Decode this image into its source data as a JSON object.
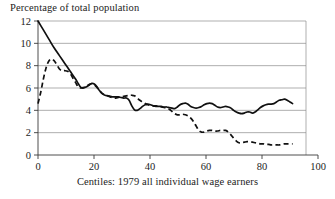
{
  "chart_data": {
    "type": "line",
    "title": "Percentage of total population",
    "xlabel": "Centiles: 1979 all individual wage earners",
    "ylabel": "",
    "xlim": [
      0,
      100
    ],
    "ylim": [
      0,
      12
    ],
    "grid": true,
    "legend": "none",
    "xticks": [
      "0",
      "20",
      "40",
      "60",
      "80",
      "100"
    ],
    "xtick_values": [
      0,
      20,
      40,
      60,
      80,
      100
    ],
    "yticks": [
      "0",
      "2",
      "4",
      "6",
      "8",
      "10",
      "12"
    ],
    "ytick_values": [
      0,
      2,
      4,
      6,
      8,
      10,
      12
    ],
    "series": [
      {
        "name": "solid-series",
        "style": "solid",
        "x": [
          0,
          2,
          4,
          6,
          8,
          10,
          12,
          14,
          15,
          16,
          17,
          18,
          19,
          20,
          21,
          22,
          23,
          24,
          25,
          26,
          27,
          28,
          29,
          30,
          31,
          32,
          33,
          34,
          35,
          36,
          37,
          38,
          39,
          40,
          41,
          42,
          43,
          44,
          45,
          46,
          47,
          48,
          49,
          50,
          51,
          52,
          53,
          54,
          55,
          56,
          57,
          58,
          59,
          60,
          61,
          62,
          63,
          64,
          65,
          66,
          67,
          68,
          69,
          70,
          71,
          72,
          73,
          74,
          75,
          76,
          77,
          78,
          79,
          80,
          81,
          82,
          83,
          84,
          85,
          86,
          87,
          88,
          89,
          90,
          91,
          92,
          93,
          94,
          95
        ],
        "y": [
          12.0,
          11.2,
          10.4,
          9.6,
          8.9,
          8.2,
          7.5,
          6.8,
          6.4,
          6.05,
          6.0,
          6.1,
          6.25,
          6.4,
          6.35,
          6.1,
          5.75,
          5.5,
          5.35,
          5.3,
          5.25,
          5.2,
          5.2,
          5.2,
          5.15,
          5.1,
          5.1,
          4.9,
          4.4,
          4.05,
          4.0,
          4.15,
          4.35,
          4.5,
          4.55,
          4.5,
          4.4,
          4.35,
          4.35,
          4.35,
          4.3,
          4.3,
          4.25,
          4.2,
          4.15,
          4.3,
          4.5,
          4.6,
          4.65,
          4.55,
          4.35,
          4.25,
          4.2,
          4.25,
          4.35,
          4.5,
          4.6,
          4.65,
          4.6,
          4.45,
          4.3,
          4.25,
          4.3,
          4.35,
          4.3,
          4.2,
          4.0,
          3.85,
          3.75,
          3.7,
          3.75,
          3.85,
          3.85,
          3.75,
          3.85,
          4.05,
          4.25,
          4.4,
          4.5,
          4.55,
          4.55,
          4.6,
          4.75,
          4.9,
          4.95,
          5.0,
          4.9,
          4.75,
          4.6
        ]
      },
      {
        "name": "dashed-series",
        "style": "dashed",
        "x": [
          0,
          1,
          2,
          3,
          4,
          5,
          6,
          7,
          8,
          9,
          10,
          11,
          12,
          13,
          14,
          15,
          16,
          17,
          18,
          19,
          20,
          21,
          22,
          23,
          24,
          25,
          26,
          27,
          28,
          29,
          30,
          31,
          32,
          33,
          34,
          35,
          36,
          37,
          38,
          39,
          40,
          41,
          42,
          43,
          44,
          45,
          46,
          47,
          48,
          49,
          50,
          51,
          52,
          53,
          54,
          55,
          56,
          57,
          58,
          59,
          60,
          61,
          62,
          63,
          64,
          65,
          66,
          67,
          68,
          69,
          70,
          71,
          72,
          73,
          74,
          75,
          76,
          77,
          78,
          79,
          80,
          81,
          82,
          83,
          84,
          85,
          86,
          87,
          88,
          89,
          90,
          91,
          92,
          93,
          94,
          95
        ],
        "y": [
          4.6,
          5.6,
          6.8,
          7.8,
          8.4,
          8.6,
          8.45,
          8.1,
          7.7,
          7.55,
          7.55,
          7.5,
          7.3,
          6.9,
          6.5,
          6.1,
          6.0,
          6.05,
          6.15,
          6.3,
          6.4,
          6.3,
          6.05,
          5.75,
          5.5,
          5.4,
          5.3,
          5.2,
          5.1,
          5.1,
          5.15,
          5.2,
          5.25,
          5.3,
          5.35,
          5.35,
          5.3,
          5.1,
          4.9,
          4.75,
          4.6,
          4.5,
          4.45,
          4.4,
          4.4,
          4.35,
          4.3,
          4.25,
          4.2,
          4.1,
          3.9,
          3.7,
          3.6,
          3.6,
          3.65,
          3.6,
          3.5,
          3.3,
          3.0,
          2.6,
          2.2,
          2.05,
          2.05,
          2.15,
          2.2,
          2.2,
          2.15,
          2.15,
          2.2,
          2.2,
          2.2,
          2.05,
          1.8,
          1.5,
          1.25,
          1.1,
          1.1,
          1.15,
          1.2,
          1.2,
          1.15,
          1.1,
          1.05,
          1.0,
          1.0,
          0.95,
          0.95,
          0.9,
          0.9,
          0.9,
          0.9,
          0.95,
          1.0,
          1.0,
          1.0,
          1.0
        ]
      }
    ]
  }
}
